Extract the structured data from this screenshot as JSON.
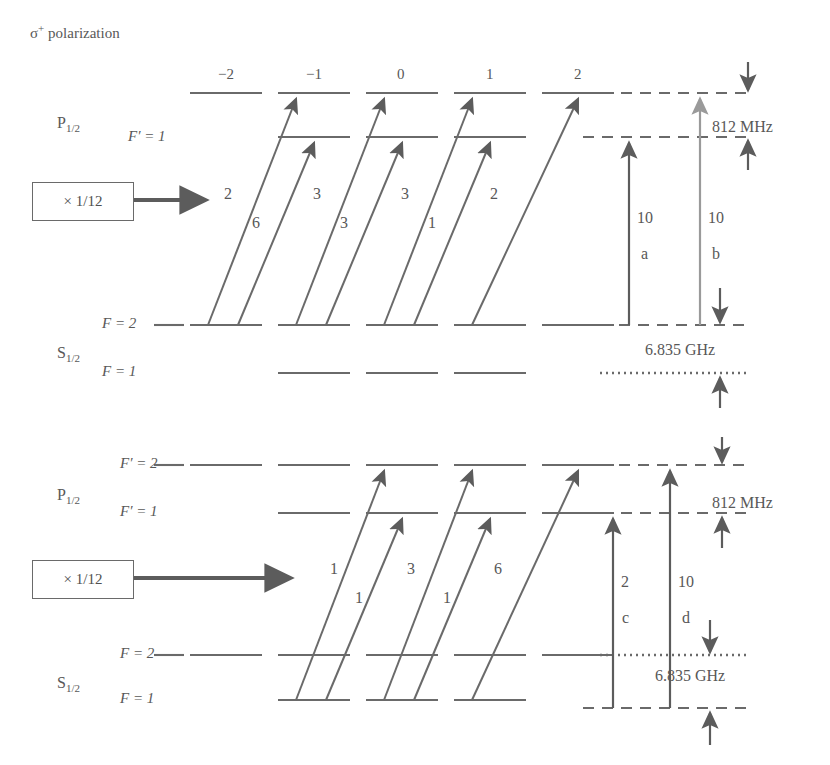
{
  "figure": {
    "title_parts": {
      "symbol": "σ",
      "superscript": "+",
      "word": " polarization"
    }
  },
  "colors": {
    "line": "#6a6a6a",
    "arrow_dark": "#5c5c5c",
    "arrow_light": "#9a9a9a",
    "text": "#585858",
    "background": "#ffffff"
  },
  "common": {
    "term_P": "P",
    "term_P_sub": "1/2",
    "term_S": "S",
    "term_S_sub": "1/2",
    "scale_box_label": "× 1/12",
    "freq_812": "812 MHz",
    "freq_6835": "6.835 GHz",
    "m_labels": [
      "−2",
      "−1",
      "0",
      "1",
      "2"
    ]
  },
  "panels": [
    {
      "id": "top-panel",
      "name": "sigma-plus-F2-excitation",
      "upper_rows": [
        {
          "label_italic": "F′",
          "label_eq": " = 2",
          "label_shown": false,
          "m_sublevels": [
            -2,
            -1,
            0,
            1,
            2
          ]
        },
        {
          "label_italic": "F′",
          "label_eq": " = 1",
          "label_shown": true,
          "m_sublevels": [
            -1,
            0,
            1
          ]
        }
      ],
      "lower_rows": [
        {
          "label_italic": "F",
          "label_eq": " = 2",
          "m_sublevels": [
            -2,
            -1,
            0,
            1,
            2
          ]
        },
        {
          "label_italic": "F",
          "label_eq": " = 1",
          "m_sublevels": [
            -1,
            0,
            1
          ]
        }
      ],
      "transition_strengths": [
        "2",
        "6",
        "3",
        "3",
        "3",
        "1",
        "2"
      ],
      "vertical_arrows": [
        {
          "strength": "10",
          "letter": "a",
          "shade": "dark"
        },
        {
          "strength": "10",
          "letter": "b",
          "shade": "light"
        }
      ],
      "freq_labels": [
        {
          "text": "812 MHz"
        },
        {
          "text": "6.835 GHz"
        }
      ]
    },
    {
      "id": "bottom-panel",
      "name": "sigma-plus-F1-excitation",
      "upper_rows": [
        {
          "label_italic": "F′",
          "label_eq": " = 2",
          "label_shown": true,
          "m_sublevels": [
            -2,
            -1,
            0,
            1,
            2
          ]
        },
        {
          "label_italic": "F′",
          "label_eq": " = 1",
          "label_shown": true,
          "m_sublevels": [
            -1,
            0,
            1,
            2
          ]
        }
      ],
      "lower_rows": [
        {
          "label_italic": "F",
          "label_eq": " = 2",
          "m_sublevels": [
            -2,
            -1,
            0,
            1,
            2
          ]
        },
        {
          "label_italic": "F",
          "label_eq": " = 1",
          "m_sublevels": [
            -1,
            0,
            1
          ]
        }
      ],
      "transition_strengths": [
        "1",
        "1",
        "3",
        "1",
        "6"
      ],
      "vertical_arrows": [
        {
          "strength": "2",
          "letter": "c",
          "shade": "dark"
        },
        {
          "strength": "10",
          "letter": "d",
          "shade": "dark"
        }
      ],
      "freq_labels": [
        {
          "text": "812 MHz"
        },
        {
          "text": "6.835 GHz"
        }
      ]
    }
  ],
  "text_items": {
    "title": "σ⁺ polarization",
    "top_P": "P",
    "top_P_sub": "1/2",
    "top_Fp1": "F′ = 1",
    "top_box": "× 1/12",
    "top_S": "S",
    "top_S_sub": "1/2",
    "top_F2": "F = 2",
    "top_F1": "F = 1",
    "top_812": "812 MHz",
    "top_6835": "6.835 GHz",
    "top_s1": "2",
    "top_s2": "6",
    "top_s3": "3",
    "top_s4": "3",
    "top_s5": "3",
    "top_s6": "1",
    "top_s7": "2",
    "top_va_10a": "10",
    "top_va_a": "a",
    "top_va_10b": "10",
    "top_va_b": "b",
    "bot_P": "P",
    "bot_P_sub": "1/2",
    "bot_Fp2": "F′ = 2",
    "bot_Fp1": "F′ = 1",
    "bot_box": "× 1/12",
    "bot_S": "S",
    "bot_S_sub": "1/2",
    "bot_F2": "F = 2",
    "bot_F1": "F = 1",
    "bot_812": "812 MHz",
    "bot_6835": "6.835 GHz",
    "bot_s1": "1",
    "bot_s2": "1",
    "bot_s3": "3",
    "bot_s4": "1",
    "bot_s5": "6",
    "bot_va_2c": "2",
    "bot_va_c": "c",
    "bot_va_10d": "10",
    "bot_va_d": "d",
    "m_neg2": "−2",
    "m_neg1": "−1",
    "m_0": "0",
    "m_1": "1",
    "m_2": "2"
  }
}
